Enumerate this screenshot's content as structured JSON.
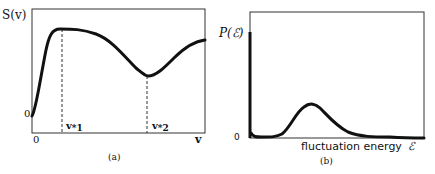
{
  "panel_a": {
    "y_label": "S(v)",
    "y_zero": "0",
    "x_zero": "0",
    "x_label": "v",
    "marker1": "v*1",
    "marker1_base": "v",
    "marker1_sub": "*1",
    "marker2_base": "v",
    "marker2_sub": "*2",
    "caption": "(a)"
  },
  "panel_b": {
    "y_label": "P(ℰ)",
    "y_zero": "0",
    "x_label": "fluctuation energy",
    "x_symbol": "ℰ",
    "caption": "(b)"
  },
  "colors": {
    "stroke": "#111111",
    "background": "#ffffff"
  }
}
